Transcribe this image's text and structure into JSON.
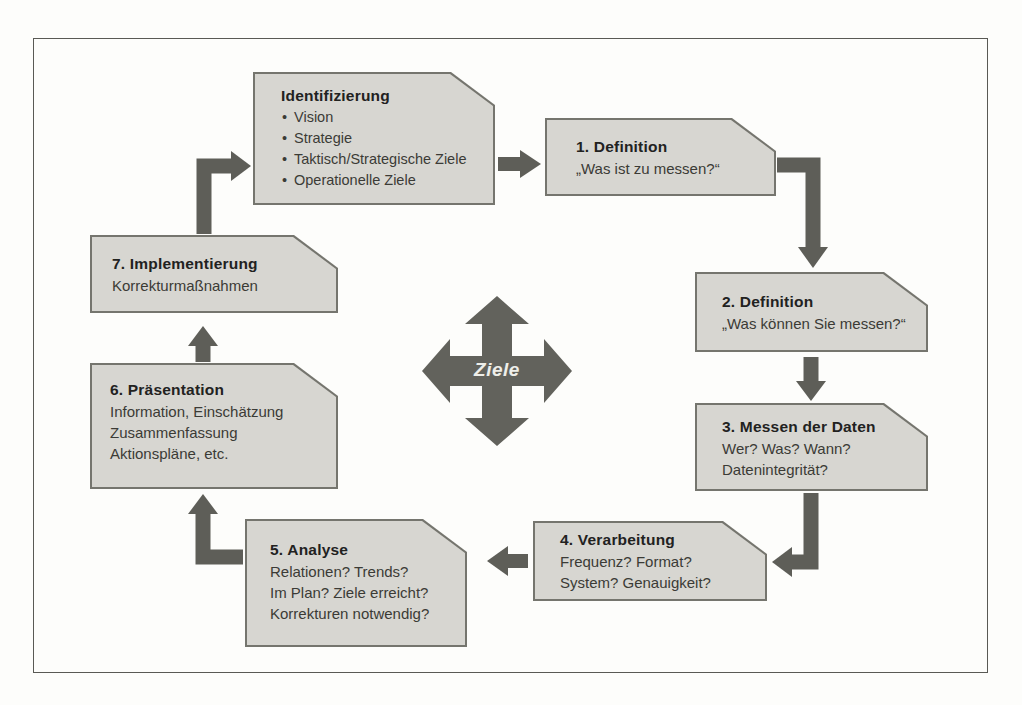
{
  "diagram": {
    "center": {
      "label": "Ziele"
    },
    "boxes": [
      {
        "id": "identifizierung",
        "title": "Identifizierung",
        "bullets": [
          "Vision",
          "Strategie",
          "Taktisch/Strategische Ziele",
          "Operationelle Ziele"
        ]
      },
      {
        "id": "definition-1",
        "title": "1. Definition",
        "lines": [
          "„Was ist zu messen?“"
        ]
      },
      {
        "id": "definition-2",
        "title": "2. Definition",
        "lines": [
          "„Was können Sie messen?“"
        ]
      },
      {
        "id": "messen-der-daten",
        "title": "3. Messen der Daten",
        "lines": [
          "Wer? Was? Wann?",
          "Datenintegrität?"
        ]
      },
      {
        "id": "verarbeitung",
        "title": "4. Verarbeitung",
        "lines": [
          "Frequenz? Format?",
          "System? Genauigkeit?"
        ]
      },
      {
        "id": "analyse",
        "title": "5. Analyse",
        "lines": [
          "Relationen? Trends?",
          "Im Plan? Ziele erreicht?",
          "Korrekturen notwendig?"
        ]
      },
      {
        "id": "praesentation",
        "title": "6. Präsentation",
        "lines": [
          "Information, Einschätzung",
          "Zusammenfassung",
          "Aktionspläne, etc."
        ]
      },
      {
        "id": "implementierung",
        "title": "7. Implementierung",
        "lines": [
          "Korrekturmaßnahmen"
        ]
      }
    ],
    "colors": {
      "box_fill": "#d7d6d1",
      "box_border": "#75756e",
      "arrow": "#5e5e58",
      "text": "#3b3b36"
    }
  }
}
